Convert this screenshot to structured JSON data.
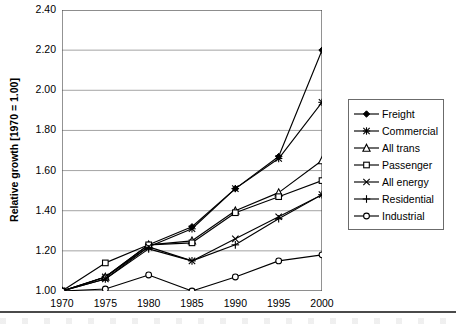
{
  "chart_data": {
    "type": "line",
    "title": "",
    "xlabel": "",
    "ylabel": "Relative growth [1970 = 1.00]",
    "x": [
      1970,
      1975,
      1980,
      1985,
      1990,
      1995,
      2000
    ],
    "categories": [
      "1970",
      "1975",
      "1980",
      "1985",
      "1990",
      "1995",
      "2000"
    ],
    "xlim": [
      1970,
      2000
    ],
    "ylim": [
      1.0,
      2.4
    ],
    "yticks": [
      "2.40",
      "2.20",
      "2.00",
      "1.80",
      "1.60",
      "1.40",
      "1.20",
      "1.00"
    ],
    "ytick_values": [
      2.4,
      2.2,
      2.0,
      1.8,
      1.6,
      1.4,
      1.2,
      1.0
    ],
    "ytick_step": 0.2,
    "grid": "horizontal",
    "legend_position": "right",
    "series": [
      {
        "name": "Freight",
        "marker": "filled-diamond",
        "values": [
          1.0,
          1.07,
          1.23,
          1.32,
          1.51,
          1.67,
          2.2
        ]
      },
      {
        "name": "Commercial",
        "marker": "asterisk",
        "values": [
          1.0,
          1.07,
          1.22,
          1.31,
          1.51,
          1.66,
          1.94
        ]
      },
      {
        "name": "All trans",
        "marker": "open-triangle",
        "values": [
          1.0,
          1.07,
          1.23,
          1.25,
          1.4,
          1.49,
          1.65
        ]
      },
      {
        "name": "Passenger",
        "marker": "open-square",
        "values": [
          1.0,
          1.14,
          1.23,
          1.24,
          1.39,
          1.47,
          1.55
        ]
      },
      {
        "name": "All energy",
        "marker": "cross-x",
        "values": [
          1.0,
          1.06,
          1.22,
          1.15,
          1.26,
          1.37,
          1.48
        ]
      },
      {
        "name": "Residential",
        "marker": "plus",
        "values": [
          1.0,
          1.06,
          1.21,
          1.15,
          1.23,
          1.36,
          1.48
        ]
      },
      {
        "name": "Industrial",
        "marker": "open-circle",
        "values": [
          1.0,
          1.01,
          1.08,
          1.0,
          1.07,
          1.15,
          1.18
        ]
      }
    ]
  },
  "legend": {
    "items": [
      {
        "label": "Freight"
      },
      {
        "label": "Commercial"
      },
      {
        "label": "All trans"
      },
      {
        "label": "Passenger"
      },
      {
        "label": "All energy"
      },
      {
        "label": "Residential"
      },
      {
        "label": "Industrial"
      }
    ]
  },
  "colors": {
    "line": "#000000",
    "grid": "#9a9a9a",
    "axis": "#4a4a4a",
    "background": "#ffffff"
  }
}
